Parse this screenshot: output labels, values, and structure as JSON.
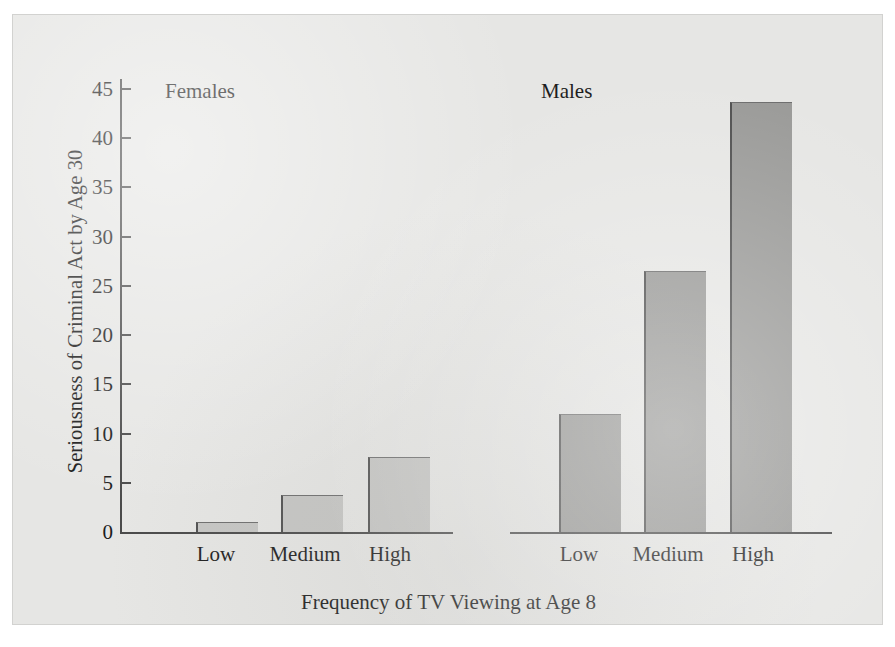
{
  "chart_data": {
    "type": "bar",
    "title": "",
    "xlabel": "Frequency of TV Viewing at Age 8",
    "ylabel": "Seriousness of Criminal Act by Age 30",
    "categories": [
      "Low",
      "Medium",
      "High"
    ],
    "panels": [
      {
        "name": "Females",
        "values": [
          1.0,
          3.8,
          7.6
        ],
        "bar_color": "#c6c6c4"
      },
      {
        "name": "Males",
        "values": [
          12.0,
          26.5,
          43.7
        ],
        "bar_color": "#9a9a98"
      }
    ],
    "ylim": [
      0,
      46
    ],
    "ytick_values": [
      0,
      5,
      10,
      15,
      20,
      25,
      30,
      35,
      40,
      45
    ],
    "ytick_labels": [
      "0",
      "5",
      "10",
      "15",
      "20",
      "25",
      "30",
      "35",
      "40",
      "45"
    ],
    "grid": false,
    "legend": "none",
    "axis_color": "#4a4a4a",
    "background_color": "#e6e6e4"
  }
}
